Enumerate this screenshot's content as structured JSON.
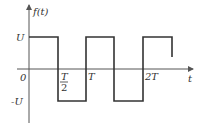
{
  "diagram": {
    "y_axis_label": "f(t)",
    "x_axis_label": "t",
    "origin_label": "0",
    "level_labels": {
      "high": "U",
      "low": "-U"
    },
    "tick_labels": {
      "half_period_num": "T",
      "half_period_den": "2",
      "period": "T",
      "two_period": "2T"
    },
    "colors": {
      "line": "#333333",
      "axis": "#555555",
      "background": "#ffffff"
    }
  }
}
